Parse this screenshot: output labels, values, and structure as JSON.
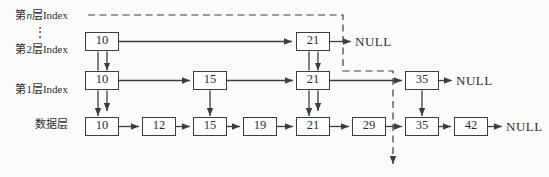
{
  "diagram": {
    "type": "skip-list-structure",
    "row_labels": {
      "level_n": {
        "prefix": "第",
        "variable": "n",
        "suffix": "层Index"
      },
      "vdots": "⋮",
      "level_2": "第2层Index",
      "level_1": "第1层Index",
      "data": "数据层"
    },
    "levels": {
      "level2": {
        "nodes": [
          "10",
          "21"
        ],
        "terminator": "NULL"
      },
      "level1": {
        "nodes": [
          "10",
          "15",
          "21",
          "35"
        ],
        "terminator": "NULL"
      },
      "data": {
        "nodes": [
          "10",
          "12",
          "15",
          "19",
          "21",
          "29",
          "35",
          "42"
        ],
        "terminator": "NULL"
      }
    },
    "colors": {
      "stroke": "#3d3d3d",
      "text": "#2e2e2e",
      "background": "#fbfbfb",
      "node_fill": "#fdfdfd"
    }
  }
}
